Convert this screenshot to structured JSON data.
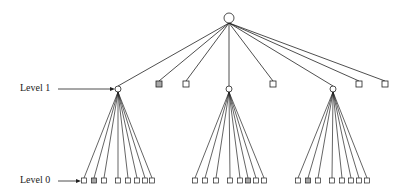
{
  "labels": {
    "level1": "Level 1",
    "level0": "Level 0"
  },
  "colors": {
    "line": "#222222",
    "node_fill": "#ffffff",
    "highlight_fill": "#a8a8a8"
  },
  "tree": {
    "root": {
      "x": 229,
      "y": 18,
      "r": 5
    },
    "level1_nodes": [
      {
        "type": "circle",
        "x": 118,
        "y": 89,
        "highlight": false
      },
      {
        "type": "square",
        "x": 159,
        "y": 84,
        "highlight": true
      },
      {
        "type": "square",
        "x": 186,
        "y": 84,
        "highlight": false
      },
      {
        "type": "circle",
        "x": 229,
        "y": 89,
        "highlight": false
      },
      {
        "type": "square",
        "x": 273,
        "y": 84,
        "highlight": false
      },
      {
        "type": "circle",
        "x": 333,
        "y": 89,
        "highlight": false
      },
      {
        "type": "square",
        "x": 359,
        "y": 84,
        "highlight": false
      },
      {
        "type": "square",
        "x": 385,
        "y": 84,
        "highlight": false
      }
    ],
    "level0_groups": [
      {
        "parent_x": 118,
        "leaves": [
          84,
          94,
          104,
          118,
          128,
          137,
          145,
          152
        ],
        "highlight_index": 1
      },
      {
        "parent_x": 229,
        "leaves": [
          195,
          205,
          216,
          230,
          240,
          248,
          256,
          264
        ],
        "highlight_index": 5
      },
      {
        "parent_x": 333,
        "leaves": [
          298,
          308,
          318,
          332,
          342,
          351,
          359,
          367
        ],
        "highlight_index": 1
      }
    ],
    "level0_y": 181
  }
}
